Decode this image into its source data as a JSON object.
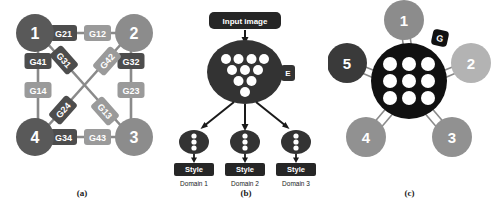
{
  "figure": {
    "panels": [
      {
        "id": "a",
        "caption": "(a)",
        "type": "multi-generator-graph",
        "nodes": [
          {
            "id": "1",
            "label": "1",
            "color": "#595959"
          },
          {
            "id": "2",
            "label": "2",
            "color": "#8c8c8c"
          },
          {
            "id": "3",
            "label": "3",
            "color": "#8c8c8c"
          },
          {
            "id": "4",
            "label": "4",
            "color": "#595959"
          }
        ],
        "edge_labels": [
          {
            "label": "G21",
            "color": "#4d4d4d"
          },
          {
            "label": "G12",
            "color": "#9a9a9a"
          },
          {
            "label": "G41",
            "color": "#4d4d4d"
          },
          {
            "label": "G14",
            "color": "#9a9a9a"
          },
          {
            "label": "G32",
            "color": "#4d4d4d"
          },
          {
            "label": "G23",
            "color": "#9a9a9a"
          },
          {
            "label": "G34",
            "color": "#4d4d4d"
          },
          {
            "label": "G43",
            "color": "#9a9a9a"
          },
          {
            "label": "G31",
            "color": "#4d4d4d"
          },
          {
            "label": "G42",
            "color": "#9a9a9a"
          },
          {
            "label": "G24",
            "color": "#4d4d4d"
          },
          {
            "label": "G13",
            "color": "#9a9a9a"
          }
        ]
      },
      {
        "id": "b",
        "caption": "(b)",
        "type": "encoder-multi-style",
        "input_box": {
          "label": "Input image",
          "color": "#262626"
        },
        "encoder": {
          "tab_label": "E",
          "color": "#333333",
          "dot_rows": [
            4,
            3,
            2,
            1
          ]
        },
        "branches": [
          {
            "style_label": "Style",
            "domain_label": "Domain 1"
          },
          {
            "style_label": "Style",
            "domain_label": "Domain 2"
          },
          {
            "style_label": "Style",
            "domain_label": "Domain 3"
          }
        ]
      },
      {
        "id": "c",
        "caption": "(c)",
        "type": "unified-generator-star",
        "generator": {
          "tab_label": "G",
          "color": "#111111",
          "grid": "3x3"
        },
        "nodes": [
          {
            "id": "1",
            "label": "1",
            "color": "#8c8c8c"
          },
          {
            "id": "2",
            "label": "2",
            "color": "#b3b3b3"
          },
          {
            "id": "3",
            "label": "3",
            "color": "#919191"
          },
          {
            "id": "4",
            "label": "4",
            "color": "#919191"
          },
          {
            "id": "5",
            "label": "5",
            "color": "#3a3a3a"
          }
        ]
      }
    ]
  },
  "colors": {
    "dark_node": "#595959",
    "light_node": "#8c8c8c",
    "dark_edge_box": "#4d4d4d",
    "light_edge_box": "#9a9a9a",
    "encoder_fill": "#333333",
    "generator_fill": "#111111",
    "dot_fill": "#ffffff",
    "background": "#ffffff"
  }
}
